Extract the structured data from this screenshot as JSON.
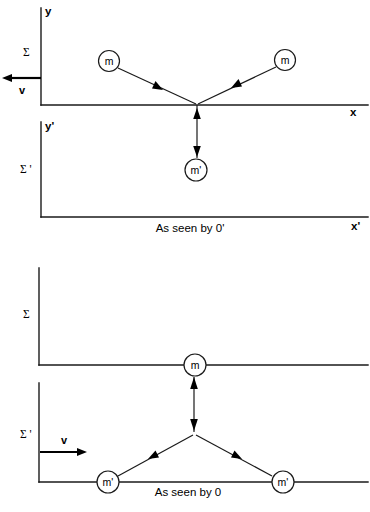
{
  "figure": {
    "background_color": "#ffffff",
    "ink_color": "#1a1a1a"
  },
  "panels": [
    {
      "id": "top",
      "caption": "As seen by 0'",
      "frames": [
        {
          "id": "top-sigma",
          "frame_label": "Σ",
          "y_axis_label": "y",
          "x_axis_label": "x",
          "velocity_label": "v",
          "velocity_direction": "left",
          "masses": [
            {
              "label": "m",
              "position": "upper-left"
            },
            {
              "label": "m",
              "position": "upper-right"
            }
          ]
        },
        {
          "id": "top-sigma-prime",
          "frame_label": "Σ '",
          "y_axis_label": "y'",
          "x_axis_label": "x'",
          "masses": [
            {
              "label": "m'",
              "position": "below-vertex"
            }
          ]
        }
      ]
    },
    {
      "id": "bottom",
      "caption": "As seen by 0",
      "frames": [
        {
          "id": "bottom-sigma",
          "frame_label": "Σ",
          "masses": [
            {
              "label": "m",
              "position": "on-axis-center"
            }
          ]
        },
        {
          "id": "bottom-sigma-prime",
          "frame_label": "Σ '",
          "velocity_label": "v",
          "velocity_direction": "right",
          "masses": [
            {
              "label": "m'",
              "position": "lower-left"
            },
            {
              "label": "m'",
              "position": "lower-right"
            }
          ]
        }
      ]
    }
  ],
  "labels": {
    "sigma": "Σ",
    "sigma_prime": "Σ '",
    "y": "y",
    "y_prime": "y'",
    "x": "x",
    "x_prime": "x'",
    "v": "v",
    "m": "m",
    "m_prime": "m'",
    "caption_top": "As seen by 0'",
    "caption_bottom": "As seen by 0"
  }
}
